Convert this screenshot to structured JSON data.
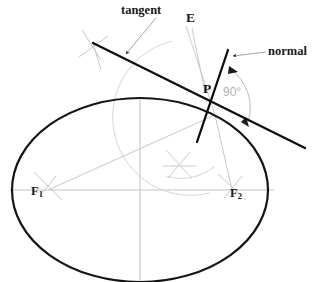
{
  "figure": {
    "background_color": "#ffffff",
    "width": 318,
    "height": 282
  },
  "labels": {
    "tangent": "tangent",
    "normal": "normal",
    "evolute_point": "E",
    "point_p": "P",
    "right_angle": "90°",
    "focus_1": "F",
    "focus_1_sub": "1",
    "focus_2": "F",
    "focus_2_sub": "2"
  },
  "colors": {
    "ellipse_stroke": "#151515",
    "tangent_stroke": "#0d0d0d",
    "normal_stroke": "#0d0d0d",
    "construction_stroke": "#c4c4c4",
    "axis_stroke": "#bdbdbd",
    "leader_stroke": "#a8a8a8",
    "angle_text": "#b0b0b0",
    "label_text": "#1a1a1a"
  },
  "geometry": {
    "ellipse": {
      "center_x": 140,
      "center_y": 190,
      "radius_x": 128,
      "radius_y": 92,
      "stroke_width": 2.2
    },
    "point_p": {
      "x": 215,
      "y": 115
    },
    "focus_1": {
      "x": 48,
      "y": 190
    },
    "focus_2": {
      "x": 232,
      "y": 190
    },
    "major_axis": {
      "x1": 10,
      "y1": 190,
      "x2": 272,
      "y2": 190
    },
    "minor_axis": {
      "x1": 140,
      "y1": 98,
      "x2": 140,
      "y2": 281
    },
    "tangent_line": {
      "x1": 93,
      "y1": 43,
      "x2": 305,
      "y2": 148
    },
    "normal_line": {
      "x1": 228,
      "y1": 50,
      "x2": 196,
      "y2": 144
    },
    "angle_value_degrees": 90
  },
  "annotations": {
    "tangent_leader": "leader line from tangent label to tangent line",
    "normal_leader": "leader line from normal label to normal line",
    "angle_arc": "90 degree arc between tangent and normal at P"
  }
}
